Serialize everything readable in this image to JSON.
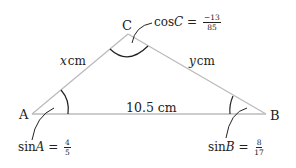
{
  "diagram": {
    "type": "triangle",
    "vertices": {
      "A": {
        "label": "A"
      },
      "B": {
        "label": "B"
      },
      "C": {
        "label": "C"
      }
    },
    "sides": {
      "AC": {
        "var": "x",
        "unit": "cm"
      },
      "BC": {
        "var": "y",
        "unit": "cm"
      },
      "AB": {
        "text": "10.5 cm"
      }
    },
    "annotations": {
      "sinA": {
        "prefix": "sin",
        "var": "A",
        "eq": " = ",
        "num": "4",
        "den": "5"
      },
      "sinB": {
        "prefix": "sin",
        "var": "B",
        "eq": " = ",
        "num": "8",
        "den": "17"
      },
      "cosC": {
        "prefix": "cos",
        "var": "C",
        "eq": " = ",
        "num": "−13",
        "den": "85"
      }
    },
    "colors": {
      "side_line": "#bbbbbb",
      "arc": "#222222",
      "text": "#222222"
    }
  }
}
